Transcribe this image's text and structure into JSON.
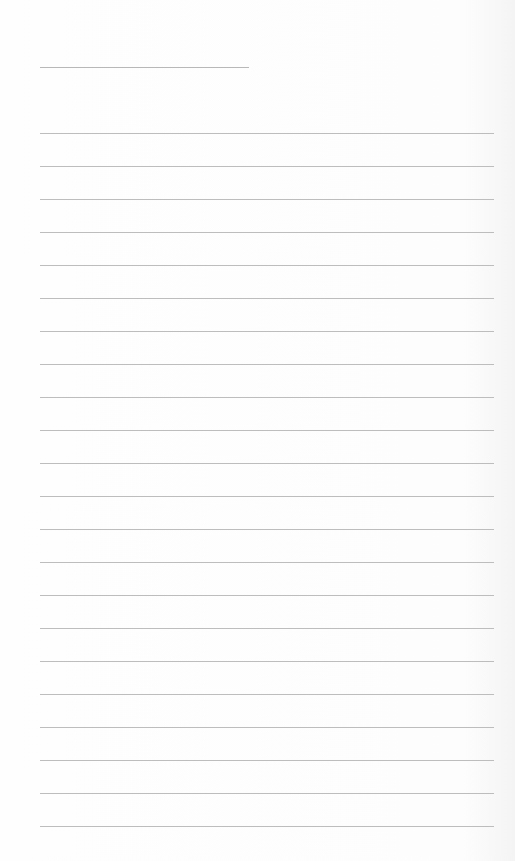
{
  "page": {
    "background": "#fdfdfd",
    "rule_color": "#bdbdbd",
    "title_line": {
      "text": ""
    },
    "lines": [
      {
        "text": ""
      },
      {
        "text": ""
      },
      {
        "text": ""
      },
      {
        "text": ""
      },
      {
        "text": ""
      },
      {
        "text": ""
      },
      {
        "text": ""
      },
      {
        "text": ""
      },
      {
        "text": ""
      },
      {
        "text": ""
      },
      {
        "text": ""
      },
      {
        "text": ""
      },
      {
        "text": ""
      },
      {
        "text": ""
      },
      {
        "text": ""
      },
      {
        "text": ""
      },
      {
        "text": ""
      },
      {
        "text": ""
      },
      {
        "text": ""
      },
      {
        "text": ""
      },
      {
        "text": ""
      },
      {
        "text": ""
      }
    ]
  }
}
